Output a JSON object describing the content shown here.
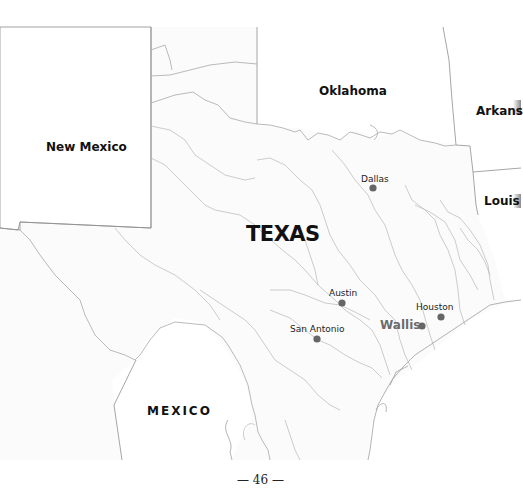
{
  "map": {
    "main_label": "TEXAS",
    "regions": [
      {
        "id": "new-mexico",
        "label": "New Mexico"
      },
      {
        "id": "oklahoma",
        "label": "Oklahoma"
      },
      {
        "id": "arkansas",
        "label": "Arkans"
      },
      {
        "id": "louisiana",
        "label": "Louis"
      },
      {
        "id": "mexico",
        "label": "MEXICO"
      }
    ],
    "cities": [
      {
        "id": "dallas",
        "label": "Dallas",
        "highlight": false
      },
      {
        "id": "austin",
        "label": "Austin",
        "highlight": false
      },
      {
        "id": "houston",
        "label": "Houston",
        "highlight": false
      },
      {
        "id": "san-antonio",
        "label": "San Antonio",
        "highlight": false
      },
      {
        "id": "wallis",
        "label": "Wallis",
        "highlight": true
      }
    ],
    "colors": {
      "city_dot": "#666666",
      "highlight_text": "#6b6b6b",
      "border": "#9a9a9a",
      "river": "#b5b5b5"
    }
  },
  "page": {
    "number_text": "— 46 —"
  }
}
